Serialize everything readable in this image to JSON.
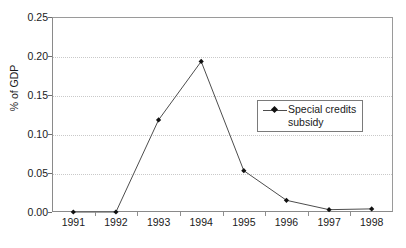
{
  "chart_data": {
    "type": "line",
    "title": "",
    "subtitle": "",
    "xlabel": "",
    "ylabel": "% of GDP",
    "categories": [
      "1991",
      "1992",
      "1993",
      "1994",
      "1995",
      "1996",
      "1997",
      "1998"
    ],
    "series": [
      {
        "name": "Special credits subsidy",
        "values": [
          0.0,
          0.0,
          0.118,
          0.193,
          0.053,
          0.015,
          0.003,
          0.004
        ]
      }
    ],
    "ylim": [
      0.0,
      0.25
    ],
    "y_ticks": [
      "0.00",
      "0.05",
      "0.10",
      "0.15",
      "0.20",
      "0.25"
    ],
    "y_tick_values": [
      0.0,
      0.05,
      0.1,
      0.15,
      0.2,
      0.25
    ],
    "grid": "horizontal-dotted",
    "legend_position": "inside-right",
    "colors": {
      "line": "#4d4d4d",
      "marker": "#111111",
      "gridline": "#c9c9c9",
      "axis": "#8a8a8a",
      "text": "#1a1a1a",
      "background": "#ffffff"
    }
  },
  "legend": {
    "entries": [
      {
        "label": "Special credits\nsubsidy",
        "marker": "diamond-marker"
      }
    ]
  },
  "axes": {
    "y_title": "% of GDP"
  }
}
